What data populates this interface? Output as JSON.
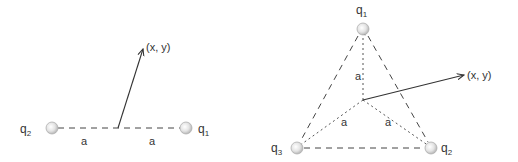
{
  "colors": {
    "line": "#333333",
    "dashed": "#444444",
    "charge_fill": "#d8d8d8",
    "charge_stroke": "#aaaaaa",
    "text": "#333333"
  },
  "figure_left": {
    "title": "two charges on a line",
    "charges": [
      {
        "name": "q",
        "sub": "2",
        "cx": 52,
        "cy": 128,
        "label_x": 20,
        "label_y": 133
      },
      {
        "name": "q",
        "sub": "1",
        "cx": 186,
        "cy": 128,
        "label_x": 200,
        "label_y": 133
      }
    ],
    "center": {
      "x": 118,
      "y": 128
    },
    "segment_labels": [
      {
        "text": "a",
        "x": 84,
        "y": 145
      },
      {
        "text": "a",
        "x": 152,
        "y": 145
      }
    ],
    "point_label": "(x, y)",
    "point": {
      "x": 144,
      "y": 46
    }
  },
  "figure_right": {
    "title": "three charges on an equilateral triangle",
    "charges": [
      {
        "name": "q",
        "sub": "1",
        "cx": 363,
        "cy": 29,
        "label_x": 356,
        "label_y": 14
      },
      {
        "name": "q",
        "sub": "2",
        "cx": 431,
        "cy": 148,
        "label_x": 441,
        "label_y": 152
      },
      {
        "name": "q",
        "sub": "3",
        "cx": 297,
        "cy": 148,
        "label_x": 271,
        "label_y": 152
      }
    ],
    "center": {
      "x": 363,
      "y": 100
    },
    "segment_labels": [
      {
        "text": "a",
        "x": 355,
        "y": 79
      },
      {
        "text": "a",
        "x": 340,
        "y": 126
      },
      {
        "text": "a",
        "x": 385,
        "y": 126
      }
    ],
    "point_label": "(x, y)",
    "point": {
      "x": 466,
      "y": 75
    }
  }
}
